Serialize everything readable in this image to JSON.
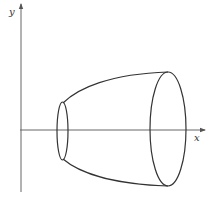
{
  "diagram": {
    "axes": {
      "x_label": "x",
      "y_label": "y",
      "color": "#555555"
    },
    "surface": {
      "stroke_color": "#333333",
      "small_section": {
        "cx": 62.5,
        "cy": 131,
        "rx": 5.5,
        "ry": 29
      },
      "large_section": {
        "cx": 168,
        "cy": 129,
        "rx": 18,
        "ry": 57
      }
    }
  }
}
